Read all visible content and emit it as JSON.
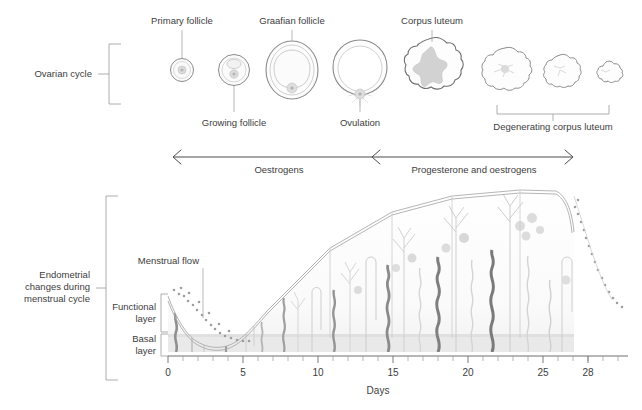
{
  "figure": {
    "title_sections": {
      "ovarian": "Ovarian cycle",
      "endometrial": "Endometrial\nchanges during\nmenstrual cycle"
    }
  },
  "ovarian_cycle": {
    "section_label": "Ovarian cycle",
    "stages": [
      {
        "id": "primary-follicle",
        "label": "Primary follicle",
        "label_position": "above",
        "cx": 182,
        "cy": 70,
        "r": 12
      },
      {
        "id": "growing-follicle",
        "label": "Growing follicle",
        "label_position": "below",
        "cx": 234,
        "cy": 70,
        "r": 16
      },
      {
        "id": "graafian-follicle",
        "label": "Graafian follicle",
        "label_position": "above",
        "cx": 292,
        "cy": 70,
        "r": 29
      },
      {
        "id": "ovulation",
        "label": "Ovulation",
        "label_position": "below",
        "cx": 360,
        "cy": 68,
        "r": 28
      },
      {
        "id": "corpus-luteum",
        "label": "Corpus luteum",
        "label_position": "above",
        "cx": 432,
        "cy": 68,
        "r": 29
      },
      {
        "id": "degenerating-1",
        "label": "",
        "label_position": "none",
        "cx": 505,
        "cy": 70,
        "r": 23
      },
      {
        "id": "degenerating-2",
        "label": "",
        "label_position": "none",
        "cx": 560,
        "cy": 70,
        "r": 18
      },
      {
        "id": "degenerating-3",
        "label": "",
        "label_position": "none",
        "cx": 606,
        "cy": 72,
        "r": 13
      }
    ],
    "degenerating_label": "Degenerating corpus luteum"
  },
  "hormone_axis": {
    "segments": [
      {
        "id": "oestrogens",
        "label": "Oestrogens",
        "x_start": 172,
        "x_end": 372
      },
      {
        "id": "progesterone-oestrogens",
        "label": "Progesterone and oestrogens",
        "x_start": 372,
        "x_end": 574
      }
    ]
  },
  "endometrium": {
    "section_label_lines": [
      "Endometrial",
      "changes during",
      "menstrual cycle"
    ],
    "layer_labels": [
      {
        "id": "functional-layer",
        "lines": [
          "Functional",
          "layer"
        ]
      },
      {
        "id": "basal-layer",
        "lines": [
          "Basal",
          "layer"
        ]
      }
    ],
    "annotations": [
      {
        "id": "menstrual-flow",
        "label": "Menstrual flow",
        "x": 150,
        "y": 262
      }
    ]
  },
  "x_axis": {
    "title": "Days",
    "ticks": [
      0,
      5,
      10,
      15,
      20,
      25,
      28
    ],
    "tick_labels": [
      "0",
      "5",
      "10",
      "15",
      "20",
      "25",
      "28"
    ],
    "range": [
      0,
      30
    ],
    "minor_tick_interval": 1
  },
  "chart_data": {
    "type": "area",
    "xlabel": "Days",
    "ylabel": "",
    "xlim": [
      0,
      30
    ],
    "ylim": [
      0,
      1
    ],
    "categories": [
      0,
      1,
      2,
      3,
      4,
      5,
      6,
      7,
      8,
      9,
      10,
      11,
      12,
      13,
      14,
      15,
      16,
      17,
      18,
      19,
      20,
      21,
      22,
      23,
      24,
      25,
      26,
      27,
      28,
      29,
      30
    ],
    "series": [
      {
        "name": "Functional layer thickness",
        "values": [
          0.62,
          0.5,
          0.4,
          0.3,
          0.22,
          0.17,
          0.18,
          0.24,
          0.32,
          0.4,
          0.48,
          0.55,
          0.62,
          0.68,
          0.73,
          0.78,
          0.82,
          0.86,
          0.89,
          0.92,
          0.94,
          0.96,
          0.97,
          0.98,
          0.98,
          0.96,
          0.9,
          0.78,
          0.62,
          0.45,
          0.3
        ]
      },
      {
        "name": "Basal layer thickness",
        "values": [
          0.13,
          0.13,
          0.13,
          0.13,
          0.13,
          0.13,
          0.13,
          0.13,
          0.13,
          0.13,
          0.13,
          0.13,
          0.13,
          0.13,
          0.13,
          0.13,
          0.13,
          0.13,
          0.13,
          0.13,
          0.13,
          0.13,
          0.13,
          0.13,
          0.13,
          0.13,
          0.13,
          0.13,
          0.13,
          0.13,
          0.13
        ]
      }
    ],
    "annotations": [
      {
        "label": "Menstrual flow",
        "x": 2,
        "note": "shedding of functional layer, days 0-5"
      },
      {
        "label": "Oestrogens",
        "x_range": [
          0,
          14
        ]
      },
      {
        "label": "Progesterone and oestrogens",
        "x_range": [
          14,
          28
        ]
      }
    ],
    "grid": false,
    "legend": "none"
  },
  "colors": {
    "outline": "#8c8c8c",
    "text": "#3d3d3d",
    "basal_band": "#e6e6e6",
    "gland_pale": "#d8d8d8",
    "artery_dark": "#9a9a9a",
    "artery_mid": "#b8b8b8",
    "tissue_fill": "#fbfbfb",
    "stroma": "#efefef"
  }
}
